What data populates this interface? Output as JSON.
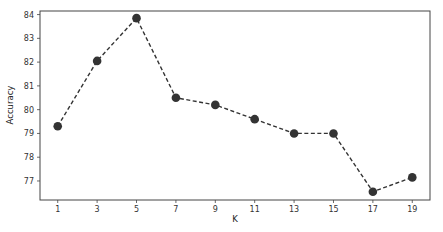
{
  "chart_data": {
    "type": "line",
    "title": "",
    "xlabel": "K",
    "ylabel": "Accuracy",
    "x": [
      1,
      3,
      5,
      7,
      9,
      11,
      13,
      15,
      17,
      19
    ],
    "series": [
      {
        "name": "Accuracy",
        "values": [
          79.3,
          82.05,
          83.85,
          80.5,
          80.2,
          79.6,
          79.0,
          79.0,
          76.55,
          77.15
        ],
        "line_style": "dashed",
        "marker": "circle",
        "color": "#333333"
      }
    ],
    "xticks": [
      "1",
      "3",
      "5",
      "7",
      "9",
      "11",
      "13",
      "15",
      "17",
      "19"
    ],
    "yticks": [
      "77",
      "78",
      "79",
      "80",
      "81",
      "82",
      "83",
      "84"
    ],
    "xlim": [
      0.1,
      19.9
    ],
    "ylim": [
      76.2,
      84.15
    ],
    "grid": false,
    "legend": null
  }
}
